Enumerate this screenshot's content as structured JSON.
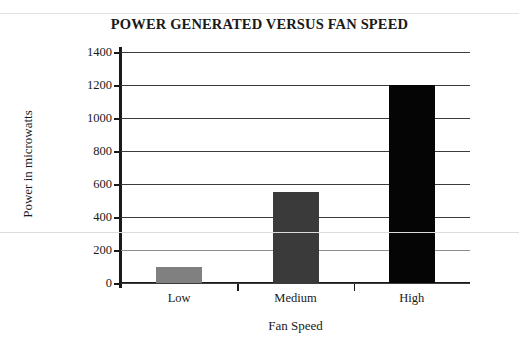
{
  "chart_data": {
    "type": "bar",
    "title": "POWER GENERATED VERSUS FAN SPEED",
    "xlabel": "Fan Speed",
    "ylabel": "Power in microwatts",
    "categories": [
      "Low",
      "Medium",
      "High"
    ],
    "values": [
      100,
      550,
      1200
    ],
    "series": [
      {
        "name": "Power generated",
        "values": [
          100,
          550,
          1200
        ]
      }
    ],
    "ylim": [
      0,
      1400
    ],
    "yticks": [
      0,
      200,
      400,
      600,
      800,
      1000,
      1200,
      1400
    ],
    "ytick_labels": [
      "0",
      "200",
      "400",
      "600",
      "800",
      "1000",
      "1200",
      "1400"
    ],
    "grid": true,
    "legend": "none",
    "bar_colors": [
      "#808080",
      "#3a3a3a",
      "#050505"
    ],
    "axis_color": "#1a1a1a",
    "gridline_color": "#3c3c3c",
    "background": "#ffffff"
  }
}
